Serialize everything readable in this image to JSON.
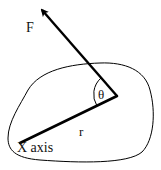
{
  "diagram": {
    "type": "torque-diagram",
    "labels": {
      "force": "F",
      "angle": "θ",
      "radius": "r",
      "axis": "X axis"
    },
    "elements": [
      {
        "id": "body-outline",
        "description": "irregular rigid body outline"
      },
      {
        "id": "force-vector",
        "description": "arrow labeled F applied at the point"
      },
      {
        "id": "radius-line",
        "description": "line r from axis to point of force application"
      },
      {
        "id": "angle-arc",
        "description": "angle θ between r and F"
      }
    ],
    "colors": {
      "stroke": "#000000",
      "background": "#ffffff"
    }
  }
}
